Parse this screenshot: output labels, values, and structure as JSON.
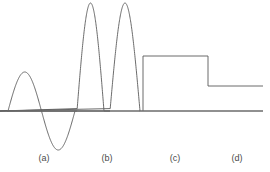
{
  "figure": {
    "width": 270,
    "height": 172,
    "background_color": "#ffffff",
    "stroke_color": "#5a5a5a",
    "baseline_color": "#6b6b6b",
    "label_color": "#4a4a4a",
    "stroke_width": 0.9,
    "baseline_width": 1.3
  },
  "axis": {
    "baseline_y": 111,
    "x_start": 7,
    "x_end": 263
  },
  "labels": [
    {
      "text": "(a)",
      "x": 44,
      "y": 160
    },
    {
      "text": "(b)",
      "x": 107,
      "y": 160
    },
    {
      "text": "(c)",
      "x": 175,
      "y": 160
    },
    {
      "text": "(d)",
      "x": 237,
      "y": 160
    }
  ],
  "chart_data": {
    "type": "line",
    "title": "",
    "xlabel": "",
    "ylabel": "",
    "grid": false,
    "legend_position": "none",
    "xlim": [
      0,
      270
    ],
    "ylim": [
      172,
      0
    ],
    "baseline_value": 111,
    "annotations": [
      "(a)",
      "(b)",
      "(c)",
      "(d)"
    ],
    "segments": [
      {
        "name": "a",
        "label": "(a)",
        "waveform": "full-sine-cycle",
        "x_start": 8,
        "x_end": 75,
        "peak_x": 27,
        "peak_y": 72,
        "trough_x": 58,
        "trough_y": 150,
        "zero_crossing_x": 45,
        "amplitude_up": 39,
        "amplitude_down": 39
      },
      {
        "name": "b",
        "label": "(b)",
        "waveform": "two-rectified-half-sine-pulses",
        "x_start": 77,
        "x_end": 140,
        "pulses": [
          {
            "x_start": 77,
            "peak_x": 89,
            "x_end": 104,
            "peak_y": 3
          },
          {
            "x_start": 110,
            "peak_x": 122,
            "x_end": 140,
            "peak_y": 3
          }
        ],
        "amplitude_up": 108
      },
      {
        "name": "c",
        "label": "(c)",
        "waveform": "rectangular-pulse",
        "rise_x": 143,
        "fall_x": 208,
        "top_y": 56,
        "amplitude_up": 55
      },
      {
        "name": "d",
        "label": "(d)",
        "waveform": "step-level",
        "x_start": 208,
        "x_end": 263,
        "level_y": 86,
        "amplitude_up": 25
      }
    ]
  }
}
